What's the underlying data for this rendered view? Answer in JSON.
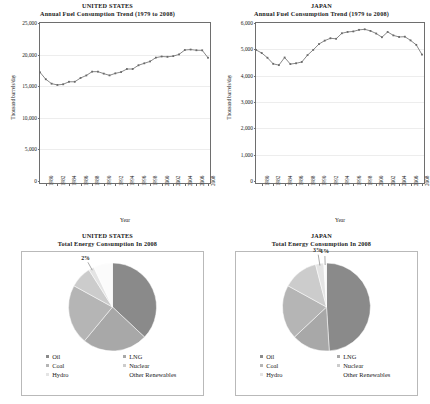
{
  "colors": {
    "oil": "#8a8a8a",
    "lng": "#a8a8a8",
    "coal": "#b5b5b5",
    "nuclear": "#cccccc",
    "hydro": "#e4e4e4",
    "other_renewables": "#fbfbfb",
    "line": "#6a6a6a",
    "frame": "#6e6e6e",
    "grid": "#ededed"
  },
  "panels": {
    "us_line": {
      "title_line1": "UNITED STATES",
      "title_line2": "Annual Fuel Consumption Trend (1979 to 2008)"
    },
    "japan_line": {
      "title_line1": "JAPAN",
      "title_line2": "Annual Fuel Consumption Trend (1979 to 2008)"
    },
    "us_pie": {
      "title_line1": "UNITED STATES",
      "title_line2": "Total Energy Consumption In 2008"
    },
    "japan_pie": {
      "title_line1": "JAPAN",
      "title_line2": "Total Energy Consumption In 2008"
    }
  },
  "legend": {
    "items": [
      {
        "label": "Oil",
        "color_key": "oil"
      },
      {
        "label": "LNG",
        "color_key": "lng"
      },
      {
        "label": "Coal",
        "color_key": "coal"
      },
      {
        "label": "Nuclear",
        "color_key": "nuclear"
      },
      {
        "label": "Hydro",
        "color_key": "hydro"
      },
      {
        "label": "Other Renewables",
        "color_key": "other_renewables"
      }
    ]
  },
  "chart_data": [
    {
      "id": "us_line",
      "type": "line",
      "title": "UNITED STATES Annual Fuel Consumption Trend (1979 to 2008)",
      "xlabel": "Year",
      "ylabel": "Thousand barrels/day",
      "ylim": [
        0,
        25000
      ],
      "yticks": [
        0,
        5000,
        10000,
        15000,
        20000,
        25000
      ],
      "ytick_labels": [
        "0",
        "5,000",
        "10,000",
        "15,000",
        "20,000",
        "25,000"
      ],
      "xlim": [
        1979,
        2008
      ],
      "xticks": [
        1980,
        1982,
        1984,
        1986,
        1988,
        1990,
        1992,
        1994,
        1996,
        1998,
        2000,
        2002,
        2004,
        2006,
        2008
      ],
      "xtick_labels": [
        "1980",
        "1982",
        "1984",
        "1986",
        "1988",
        "1990",
        "1992",
        "1994",
        "1996",
        "1998",
        "2000",
        "2002",
        "2004",
        "2006",
        "2008"
      ],
      "grid": true,
      "markers": true,
      "x": [
        1979,
        1980,
        1981,
        1982,
        1983,
        1984,
        1985,
        1986,
        1987,
        1988,
        1989,
        1990,
        1991,
        1992,
        1993,
        1994,
        1995,
        1996,
        1997,
        1998,
        1999,
        2000,
        2001,
        2002,
        2003,
        2004,
        2005,
        2006,
        2007,
        2008
      ],
      "values": [
        17200,
        16100,
        15400,
        15200,
        15300,
        15700,
        15700,
        16300,
        16700,
        17300,
        17300,
        16990,
        16710,
        17030,
        17240,
        17720,
        17720,
        18310,
        18620,
        18920,
        19520,
        19700,
        19650,
        19760,
        20030,
        20730,
        20800,
        20690,
        20680,
        19500
      ]
    },
    {
      "id": "japan_line",
      "type": "line",
      "title": "JAPAN Annual Fuel Consumption Trend (1979 to 2008)",
      "xlabel": "Year",
      "ylabel": "Thousand barrels/day",
      "ylim": [
        0,
        6000
      ],
      "yticks": [
        0,
        1000,
        2000,
        3000,
        4000,
        5000,
        6000
      ],
      "ytick_labels": [
        "0",
        "1,000",
        "2,000",
        "3,000",
        "4,000",
        "5,000",
        "6,000"
      ],
      "xlim": [
        1979,
        2008
      ],
      "xticks": [
        1980,
        1982,
        1984,
        1986,
        1988,
        1990,
        1992,
        1994,
        1996,
        1998,
        2000,
        2002,
        2004,
        2006,
        2008
      ],
      "xtick_labels": [
        "1980",
        "1982",
        "1984",
        "1986",
        "1988",
        "1990",
        "1992",
        "1994",
        "1996",
        "1998",
        "2000",
        "2002",
        "2004",
        "2006",
        "2008"
      ],
      "grid": true,
      "markers": true,
      "x": [
        1979,
        1980,
        1981,
        1982,
        1983,
        1984,
        1985,
        1986,
        1987,
        1988,
        1989,
        1990,
        1991,
        1992,
        1993,
        1994,
        1995,
        1996,
        1997,
        1998,
        1999,
        2000,
        2001,
        2002,
        2003,
        2004,
        2005,
        2006,
        2007,
        2008
      ],
      "values": [
        4980,
        4860,
        4680,
        4450,
        4400,
        4690,
        4440,
        4470,
        4520,
        4780,
        4980,
        5200,
        5330,
        5420,
        5400,
        5610,
        5660,
        5680,
        5740,
        5760,
        5700,
        5600,
        5460,
        5660,
        5530,
        5470,
        5480,
        5340,
        5170,
        4800
      ]
    },
    {
      "id": "us_pie",
      "type": "pie",
      "title": "UNITED STATES Total Energy Consumption In 2008",
      "labels": [
        "Oil",
        "LNG",
        "Coal",
        "Nuclear",
        "Hydro",
        "Other Renewables"
      ],
      "values": [
        37,
        24,
        22,
        8,
        2,
        7
      ],
      "value_labels": [
        "37%",
        "24%",
        "22%",
        "8%",
        "2%",
        "7%"
      ],
      "legend_position": "bottom"
    },
    {
      "id": "japan_pie",
      "type": "pie",
      "title": "JAPAN Total Energy Consumption In 2008",
      "labels": [
        "Oil",
        "LNG",
        "Coal",
        "Nuclear",
        "Hydro",
        "Other Renewables"
      ],
      "values": [
        49,
        14,
        20,
        13,
        3,
        1
      ],
      "value_labels": [
        "49%",
        "14%",
        "20%",
        "13%",
        "3%",
        "1%"
      ],
      "legend_position": "bottom"
    }
  ]
}
